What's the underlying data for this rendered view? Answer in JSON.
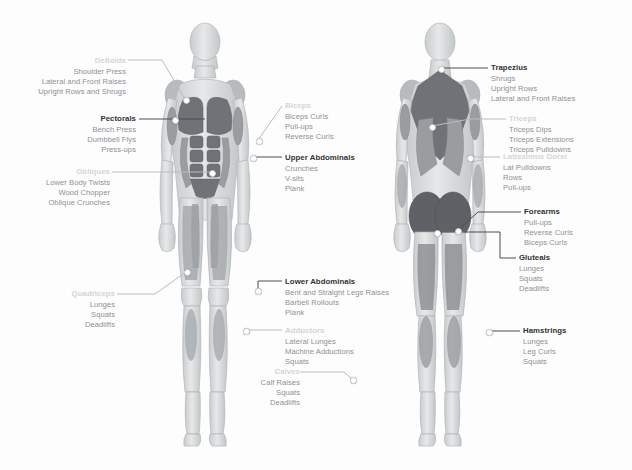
{
  "figures": {
    "front": {
      "name": "anterior-muscle-figure",
      "view": "Front View"
    },
    "back": {
      "name": "posterior-muscle-figure",
      "view": "Back View"
    }
  },
  "colors": {
    "highlight_muscle": "#6f7377",
    "body_base": "#d8dadc",
    "body_outline": "#b2b5b8",
    "heading_bold": "#2f3336",
    "heading_faint": "#d2d5d8",
    "exercise_text": "#8d9094",
    "leader_line": "#4b4f53",
    "marker_dot": "#ffffff"
  },
  "callouts": [
    {
      "id": "deltoids",
      "heading": "Deltoids",
      "style": "faint",
      "align": "right",
      "side": "left",
      "exercises": [
        "Shoulder Press",
        "Lateral and Front Raises",
        "Upright Rows and Shrugs"
      ]
    },
    {
      "id": "pectorals",
      "heading": "Pectorals",
      "style": "bold",
      "align": "right",
      "side": "left",
      "exercises": [
        "Bench Press",
        "Dumbbell Flys",
        "Press-ups"
      ]
    },
    {
      "id": "obliques",
      "heading": "Obliques",
      "style": "faint",
      "align": "right",
      "side": "left",
      "exercises": [
        "Lower Body Twists",
        "Wood Chopper",
        "Oblique Crunches"
      ]
    },
    {
      "id": "quadriceps",
      "heading": "Quadriceps",
      "style": "faint",
      "align": "right",
      "side": "left",
      "exercises": [
        "Lunges",
        "Squats",
        "Deadlifts"
      ]
    },
    {
      "id": "biceps",
      "heading": "Biceps",
      "style": "faint",
      "align": "left",
      "side": "center",
      "exercises": [
        "Biceps Curls",
        "Pull-ups",
        "Reverse Curls"
      ]
    },
    {
      "id": "upper-abdominals",
      "heading": "Upper Abdominals",
      "style": "bold",
      "align": "left",
      "side": "center",
      "exercises": [
        "Crunches",
        "V-sits",
        "Plank"
      ]
    },
    {
      "id": "lower-abdominals",
      "heading": "Lower Abdominals",
      "style": "bold",
      "align": "left",
      "side": "center",
      "exercises": [
        "Bent and Straight Legs Raises",
        "Barbell Rollouts",
        "Plank"
      ]
    },
    {
      "id": "adductors",
      "heading": "Adductors",
      "style": "faint",
      "align": "left",
      "side": "center",
      "exercises": [
        "Lateral Lunges",
        "Machine Adductions",
        "Squats"
      ]
    },
    {
      "id": "calves",
      "heading": "Calves",
      "style": "faint",
      "align": "right",
      "side": "center",
      "exercises": [
        "Calf Raises",
        "Squats",
        "Deadlifts"
      ]
    },
    {
      "id": "trapezius",
      "heading": "Trapezius",
      "style": "bold",
      "align": "left",
      "side": "right",
      "exercises": [
        "Shrugs",
        "Upright Rows",
        "Lateral and Front Raises"
      ]
    },
    {
      "id": "triceps",
      "heading": "Triceps",
      "style": "faint",
      "align": "left",
      "side": "right",
      "exercises": [
        "Triceps Dips",
        "Triceps Extensions",
        "Triceps Pulldowns"
      ]
    },
    {
      "id": "latissimus-dorsi",
      "heading": "Latissimus Dorsi",
      "style": "faint",
      "align": "left",
      "side": "right",
      "exercises": [
        "Lat Pulldowns",
        "Rows",
        "Pull-ups"
      ]
    },
    {
      "id": "forearms",
      "heading": "Forearms",
      "style": "bold",
      "align": "left",
      "side": "right",
      "exercises": [
        "Pull-ups",
        "Reverse Curls",
        "Biceps Curls"
      ]
    },
    {
      "id": "gluteals",
      "heading": "Gluteals",
      "style": "bold",
      "align": "left",
      "side": "right",
      "exercises": [
        "Lunges",
        "Squats",
        "Deadlifts"
      ]
    },
    {
      "id": "hamstrings",
      "heading": "Hamstrings",
      "style": "bold",
      "align": "left",
      "side": "right",
      "exercises": [
        "Lunges",
        "Leg Curls",
        "Squats"
      ]
    }
  ]
}
